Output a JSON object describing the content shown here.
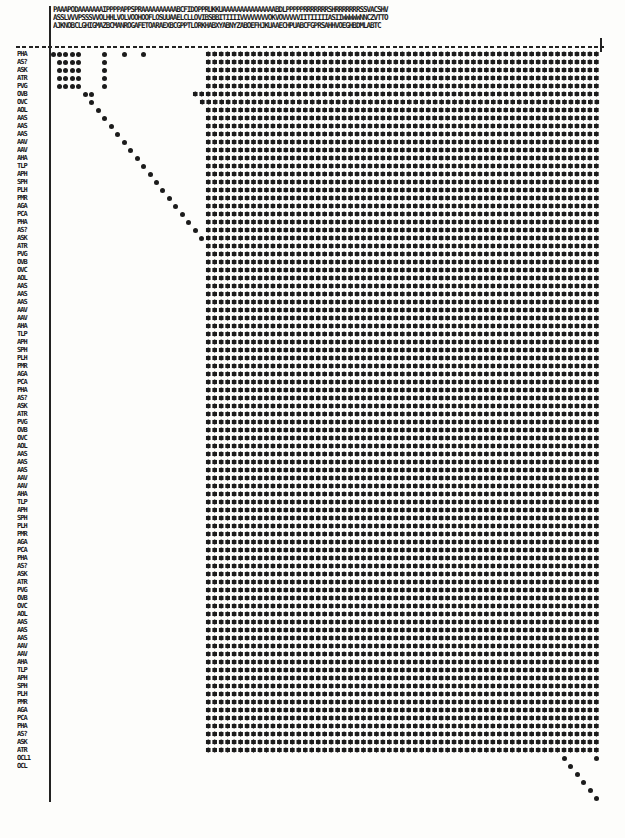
{
  "document": {
    "type": "dot-matrix similarity plot (scanned printout)",
    "header_lines": [
      "PAAAPODAAAAAAAIPPPPAPPSPRAAAAAAAAAABCFIDOPPRUKKUAAAAAAAAAAAAAAABDLPPPPPRRRRRRRSHRRRRRRRSSVACSHV",
      "ASSLVVVPSSSVVOLHHLVOLVOOHOOFLOSUUAAELCLLOVIBSBBITIIIIVVVVVVVVOKVOVVVVVIITIIIIIASIIWWWWWNNCZVTTO",
      "AJKNOBCLGHIGMAZBCMANROGAFETOARAEXBCGPPTLORKHABXYABNYZABOEFHJKUAAECHPUABCFGPRSAHHVOEGHBDMLABTC"
    ]
  },
  "chart_data": {
    "type": "heatmap",
    "title": "",
    "xlabel": "",
    "ylabel": "",
    "grid": {
      "columns": 85,
      "rows": 88,
      "col_x0": 53,
      "col_step": 6.47,
      "row_y0": 54,
      "row_step": 8
    },
    "row_labels_visible_sample": [
      "PHA",
      "AS?",
      "ASK",
      "ATR",
      "PVG",
      "OVB",
      "OVC",
      "AOL",
      "AAS",
      "AAS",
      "AAS",
      "AAV",
      "AAV",
      "AHA",
      "TLP",
      "APH",
      "SPH",
      "PLH",
      "PMR",
      "AGA",
      "PCA"
    ],
    "last_row_labels": [
      "OCL1",
      "OCL"
    ],
    "legend": "",
    "filled_block": {
      "col_start": 24,
      "col_end": 84,
      "row_start": 0,
      "row_end": 87,
      "note": "columns right of diagonal (approx.) are fully dotted"
    },
    "sparse_points": [
      {
        "r": 0,
        "c": 0
      },
      {
        "r": 0,
        "c": 1
      },
      {
        "r": 0,
        "c": 2
      },
      {
        "r": 0,
        "c": 3
      },
      {
        "r": 0,
        "c": 4
      },
      {
        "r": 0,
        "c": 8
      },
      {
        "r": 0,
        "c": 11
      },
      {
        "r": 0,
        "c": 14
      },
      {
        "r": 1,
        "c": 1
      },
      {
        "r": 1,
        "c": 2
      },
      {
        "r": 1,
        "c": 3
      },
      {
        "r": 1,
        "c": 4
      },
      {
        "r": 1,
        "c": 8
      },
      {
        "r": 2,
        "c": 1
      },
      {
        "r": 2,
        "c": 2
      },
      {
        "r": 2,
        "c": 3
      },
      {
        "r": 2,
        "c": 4
      },
      {
        "r": 2,
        "c": 8
      },
      {
        "r": 3,
        "c": 1
      },
      {
        "r": 3,
        "c": 2
      },
      {
        "r": 3,
        "c": 3
      },
      {
        "r": 3,
        "c": 4
      },
      {
        "r": 3,
        "c": 8
      },
      {
        "r": 4,
        "c": 1
      },
      {
        "r": 4,
        "c": 2
      },
      {
        "r": 4,
        "c": 3
      },
      {
        "r": 4,
        "c": 4
      },
      {
        "r": 4,
        "c": 8
      },
      {
        "r": 5,
        "c": 5
      },
      {
        "r": 5,
        "c": 6
      },
      {
        "r": 6,
        "c": 6
      },
      {
        "r": 7,
        "c": 7
      },
      {
        "r": 8,
        "c": 8
      },
      {
        "r": 9,
        "c": 9
      },
      {
        "r": 10,
        "c": 10
      },
      {
        "r": 11,
        "c": 11
      },
      {
        "r": 12,
        "c": 12
      },
      {
        "r": 13,
        "c": 13
      },
      {
        "r": 14,
        "c": 14
      },
      {
        "r": 15,
        "c": 15
      },
      {
        "r": 16,
        "c": 16
      },
      {
        "r": 17,
        "c": 17
      },
      {
        "r": 18,
        "c": 18
      },
      {
        "r": 19,
        "c": 19
      },
      {
        "r": 20,
        "c": 20
      },
      {
        "r": 21,
        "c": 21
      },
      {
        "r": 22,
        "c": 22
      },
      {
        "r": 23,
        "c": 23
      }
    ],
    "block_left_edge_by_row": [
      {
        "r": 0,
        "c": 24
      },
      {
        "r": 1,
        "c": 24
      },
      {
        "r": 2,
        "c": 24
      },
      {
        "r": 3,
        "c": 24
      },
      {
        "r": 4,
        "c": 24
      },
      {
        "r": 5,
        "c": 22
      },
      {
        "r": 6,
        "c": 23
      },
      {
        "r": 7,
        "c": 24
      }
    ],
    "tail_points": [
      {
        "r": 88,
        "c": 79
      },
      {
        "r": 88,
        "c": 84
      },
      {
        "r": 89,
        "c": 80
      },
      {
        "r": 90,
        "c": 81
      },
      {
        "r": 91,
        "c": 82
      },
      {
        "r": 92,
        "c": 83
      },
      {
        "r": 93,
        "c": 84
      }
    ]
  }
}
